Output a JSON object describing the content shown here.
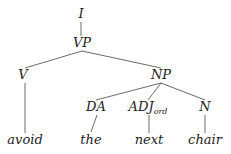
{
  "diagram": {
    "type": "parse-tree",
    "nodes": [
      {
        "id": "I",
        "label": "I",
        "sub": "",
        "x": 81,
        "y": 18
      },
      {
        "id": "VP",
        "label": "VP",
        "sub": "",
        "x": 82,
        "y": 47
      },
      {
        "id": "V",
        "label": "V",
        "sub": "",
        "x": 23,
        "y": 79
      },
      {
        "id": "NP",
        "label": "NP",
        "sub": "",
        "x": 161,
        "y": 79
      },
      {
        "id": "DA",
        "label": "DA",
        "sub": "",
        "x": 96,
        "y": 111
      },
      {
        "id": "ADJ",
        "label": "ADJ",
        "sub": "ord",
        "x": 148,
        "y": 111
      },
      {
        "id": "N",
        "label": "N",
        "sub": "",
        "x": 205,
        "y": 111
      },
      {
        "id": "avoid",
        "label": "avoid",
        "sub": "",
        "x": 25,
        "y": 144
      },
      {
        "id": "the",
        "label": "the",
        "sub": "",
        "x": 91,
        "y": 144
      },
      {
        "id": "next",
        "label": "next",
        "sub": "",
        "x": 149,
        "y": 144
      },
      {
        "id": "chair",
        "label": "chair",
        "sub": "",
        "x": 205,
        "y": 144
      }
    ],
    "edges": [
      {
        "from": "I",
        "to": "VP",
        "x1": 81,
        "y1": 22,
        "x2": 81,
        "y2": 36
      },
      {
        "from": "VP",
        "to": "V",
        "x1": 82,
        "y1": 51,
        "x2": 25,
        "y2": 68
      },
      {
        "from": "VP",
        "to": "NP",
        "x1": 82,
        "y1": 51,
        "x2": 161,
        "y2": 68
      },
      {
        "from": "V",
        "to": "avoid",
        "x1": 25,
        "y1": 83,
        "x2": 25,
        "y2": 133
      },
      {
        "from": "NP",
        "to": "DA",
        "x1": 161,
        "y1": 83,
        "x2": 96,
        "y2": 100
      },
      {
        "from": "NP",
        "to": "ADJ",
        "x1": 161,
        "y1": 83,
        "x2": 148,
        "y2": 100
      },
      {
        "from": "NP",
        "to": "N",
        "x1": 161,
        "y1": 83,
        "x2": 205,
        "y2": 100
      },
      {
        "from": "DA",
        "to": "the",
        "x1": 97,
        "y1": 115,
        "x2": 91,
        "y2": 132
      },
      {
        "from": "ADJ",
        "to": "next",
        "x1": 149,
        "y1": 115,
        "x2": 149,
        "y2": 133
      },
      {
        "from": "N",
        "to": "chair",
        "x1": 205,
        "y1": 115,
        "x2": 205,
        "y2": 133
      }
    ]
  }
}
